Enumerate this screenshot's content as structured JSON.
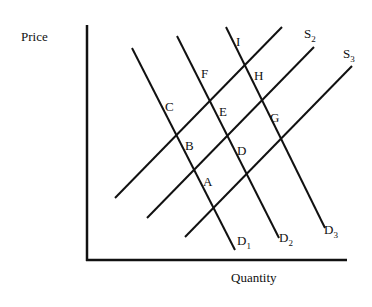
{
  "diagram": {
    "type": "supply-demand",
    "axes": {
      "y_label": "Price",
      "x_label": "Quantity"
    },
    "demand_curves": [
      {
        "name": "D",
        "sub": "1",
        "x1": 132,
        "y1": 48,
        "x2": 235,
        "y2": 250,
        "lx": 237,
        "ly": 245
      },
      {
        "name": "D",
        "sub": "2",
        "x1": 177,
        "y1": 36,
        "x2": 279,
        "y2": 238,
        "lx": 279,
        "ly": 242
      },
      {
        "name": "D",
        "sub": "3",
        "x1": 226,
        "y1": 27,
        "x2": 325,
        "y2": 228,
        "lx": 324,
        "ly": 234
      }
    ],
    "supply_curves": [
      {
        "name": "S",
        "sub": "",
        "x1": 115,
        "y1": 198,
        "x2": 282,
        "y2": 27,
        "lx": null,
        "ly": null
      },
      {
        "name": "S",
        "sub": "2",
        "x1": 147,
        "y1": 218,
        "x2": 314,
        "y2": 47,
        "lx": 304,
        "ly": 38
      },
      {
        "name": "S",
        "sub": "3",
        "x1": 185,
        "y1": 237,
        "x2": 352,
        "y2": 66,
        "lx": 343,
        "ly": 58
      }
    ],
    "points": [
      {
        "label": "A",
        "x": 203,
        "y": 186
      },
      {
        "label": "B",
        "x": 185,
        "y": 150
      },
      {
        "label": "C",
        "x": 165,
        "y": 111
      },
      {
        "label": "D",
        "x": 237,
        "y": 155
      },
      {
        "label": "E",
        "x": 219,
        "y": 116
      },
      {
        "label": "F",
        "x": 201,
        "y": 78
      },
      {
        "label": "G",
        "x": 270,
        "y": 122
      },
      {
        "label": "H",
        "x": 254,
        "y": 80
      },
      {
        "label": "I",
        "x": 236,
        "y": 46
      }
    ],
    "colors": {
      "line": "#111111",
      "background": "#ffffff"
    }
  }
}
